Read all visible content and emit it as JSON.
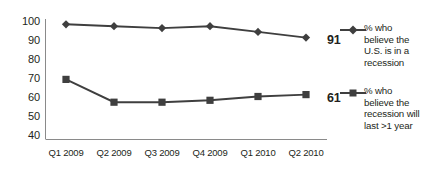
{
  "chart_data": {
    "type": "line",
    "title": "",
    "xlabel": "",
    "ylabel": "",
    "ylim": [
      40,
      100
    ],
    "yticks": [
      100,
      90,
      80,
      70,
      60,
      50,
      40
    ],
    "grid": false,
    "legend_position": "right",
    "categories": [
      "Q1 2009",
      "Q2 2009",
      "Q3 2009",
      "Q4 2009",
      "Q1 2010",
      "Q2 2010"
    ],
    "series": [
      {
        "name": "% who believe the U.S. is in a recession",
        "name_lines": [
          "% who",
          "believe the",
          "U.S. is in a",
          "recession"
        ],
        "marker": "diamond",
        "color": "#3f3f3f",
        "values": [
          98,
          97,
          96,
          97,
          94,
          91
        ],
        "end_label": "91"
      },
      {
        "name": "% who believe the recession will last >1 year",
        "name_lines": [
          "% who",
          "believe the",
          "recession will",
          "last >1 year"
        ],
        "marker": "square",
        "color": "#3f3f3f",
        "values": [
          69,
          57,
          57,
          58,
          60,
          61
        ],
        "end_label": "61"
      }
    ]
  },
  "yticks": {
    "t0": "100",
    "t1": "90",
    "t2": "80",
    "t3": "70",
    "t4": "60",
    "t5": "50",
    "t6": "40"
  },
  "xticks": {
    "t0": "Q1 2009",
    "t1": "Q2 2009",
    "t2": "Q3 2009",
    "t3": "Q4 2009",
    "t4": "Q1 2010",
    "t5": "Q2 2010"
  },
  "endlabels": {
    "series1": "91",
    "series2": "61"
  },
  "legend": {
    "series1": {
      "line1": "% who",
      "line2": "believe the",
      "line3": "U.S. is in a",
      "line4": "recession"
    },
    "series2": {
      "line1": "% who",
      "line2": "believe the",
      "line3": "recession will",
      "line4": "last >1 year"
    }
  },
  "colors": {
    "series": "#3f3f3f",
    "axis": "#808080",
    "text": "#231f20",
    "background": "#ffffff"
  }
}
